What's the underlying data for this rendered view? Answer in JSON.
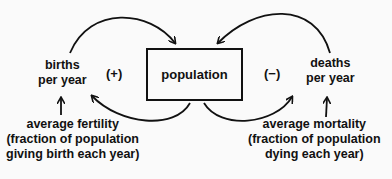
{
  "diagram": {
    "stock": {
      "label": "population"
    },
    "flows": [
      {
        "label_line1": "births",
        "label_line2": "per year",
        "sign": "(+)"
      },
      {
        "label_line1": "deaths",
        "label_line2": "per year",
        "sign": "(−)"
      }
    ],
    "parameters": [
      {
        "line1": "average fertility",
        "line2": "(fraction of population",
        "line3": "giving birth each year)"
      },
      {
        "line1": "average mortality",
        "line2": "(fraction of population",
        "line3": "dying each year)"
      }
    ],
    "colors": {
      "ink": "#111111",
      "background": "#fafafa"
    }
  }
}
